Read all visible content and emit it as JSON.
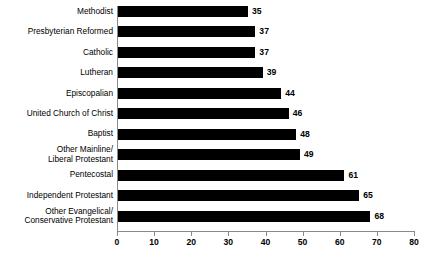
{
  "chart_data": {
    "type": "bar",
    "orientation": "horizontal",
    "title": "",
    "subtitle": "",
    "xlabel": "",
    "ylabel": "",
    "xlim": [
      0,
      80
    ],
    "xticks": [
      0,
      10,
      20,
      30,
      40,
      50,
      60,
      70,
      80
    ],
    "grid": false,
    "legend": null,
    "bar_color": "#000000",
    "axis_color": "#8a8a8a",
    "background": "#ffffff",
    "show_value_labels": true,
    "categories": [
      "Methodist",
      "Presbyterian Reformed",
      "Catholic",
      "Lutheran",
      "Episcopalian",
      "United Church of Christ",
      "Baptist",
      "Other Mainline/\nLiberal Protestant",
      "Pentecostal",
      "Independent Protestant",
      "Other Evangelical/\nConservative Protestant"
    ],
    "values": [
      35,
      37,
      37,
      39,
      44,
      46,
      48,
      49,
      61,
      65,
      68
    ]
  }
}
